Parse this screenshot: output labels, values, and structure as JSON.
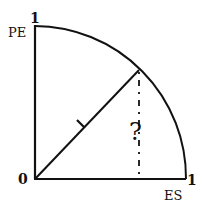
{
  "diagram": {
    "type": "unit-quarter-circle",
    "labels": {
      "y_axis_name": "PE",
      "y_axis_max": "1",
      "x_axis_name": "ES",
      "x_axis_max": "1",
      "origin": "0",
      "radius_label": "1",
      "unknown_label": "?"
    },
    "colors": {
      "stroke": "#111111",
      "background": "#ffffff"
    }
  }
}
